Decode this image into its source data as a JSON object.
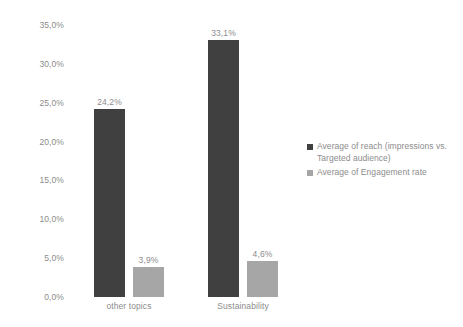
{
  "chart_data": {
    "type": "bar",
    "title": "",
    "xlabel": "",
    "ylabel": "",
    "categories": [
      "other topics",
      "Sustainability"
    ],
    "series": [
      {
        "name": "Average of reach (impressions vs. Targeted audience)",
        "color": "#404040",
        "values": [
          24.2,
          33.1
        ],
        "labels": [
          "24,2%",
          "3,9%"
        ]
      },
      {
        "name": "Average of Engagement rate",
        "color": "#a6a6a6",
        "values": [
          3.9,
          4.6
        ],
        "labels": [
          "33,1%",
          "4,6%"
        ]
      }
    ],
    "data_labels": [
      [
        "24,2%",
        "3,9%"
      ],
      [
        "33,1%",
        "4,6%"
      ]
    ],
    "ylim": [
      0,
      35
    ],
    "ytick_values": [
      0,
      5,
      10,
      15,
      20,
      25,
      30,
      35
    ],
    "ytick_labels": [
      "0,0%",
      "5,0%",
      "10,0%",
      "15,0%",
      "20,0%",
      "25,0%",
      "30,0%",
      "35,0%"
    ],
    "grid": false,
    "legend_position": "right",
    "decimal_separator": ","
  },
  "legend": {
    "items": [
      {
        "label": "Average of reach (impressions vs. Targeted audience)",
        "color": "#404040"
      },
      {
        "label": "Average of Engagement rate",
        "color": "#a6a6a6"
      }
    ]
  },
  "colors": {
    "background": "#ffffff",
    "text": "#8c8c8c",
    "series_1": "#404040",
    "series_2": "#a6a6a6"
  }
}
